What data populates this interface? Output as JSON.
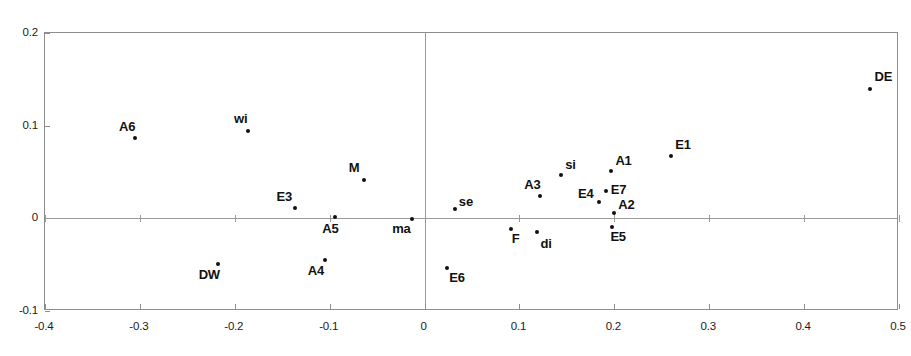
{
  "chart_data": {
    "type": "scatter",
    "title": "",
    "subtitle": "",
    "xlabel": "",
    "ylabel": "",
    "xlim": [
      -0.4,
      0.5
    ],
    "ylim": [
      -0.1,
      0.2
    ],
    "xticks": [
      "-0.4",
      "-0.3",
      "-0.2",
      "-0.1",
      "0",
      "0.1",
      "0.2",
      "0.3",
      "0.4",
      "0.5"
    ],
    "xtick_values": [
      -0.4,
      -0.3,
      -0.2,
      -0.1,
      0,
      0.1,
      0.2,
      0.3,
      0.4,
      0.5
    ],
    "yticks": [
      "0.2",
      "0.1",
      "0",
      "-0.1"
    ],
    "ytick_values": [
      0.2,
      0.1,
      0,
      -0.1
    ],
    "grid": false,
    "legend": false,
    "zero_lines": true,
    "marker_color": "#111111",
    "frame_color": "#8d8d8d",
    "axis_line_color": "#9a9a9a",
    "points": [
      {
        "label": "A6",
        "x": -0.304,
        "y": 0.086,
        "label_dx": -16,
        "label_dy": -18
      },
      {
        "label": "wi",
        "x": -0.185,
        "y": 0.093,
        "label_dx": -14,
        "label_dy": -19
      },
      {
        "label": "M",
        "x": -0.063,
        "y": 0.04,
        "label_dx": -15,
        "label_dy": -19
      },
      {
        "label": "E3",
        "x": -0.136,
        "y": 0.01,
        "label_dx": -18,
        "label_dy": -18
      },
      {
        "label": "A5",
        "x": -0.093,
        "y": 0.0,
        "label_dx": -13,
        "label_dy": 5
      },
      {
        "label": "ma",
        "x": -0.012,
        "y": -0.002,
        "label_dx": -20,
        "label_dy": 3
      },
      {
        "label": "DW",
        "x": -0.217,
        "y": -0.05,
        "label_dx": -19,
        "label_dy": 4
      },
      {
        "label": "A4",
        "x": -0.104,
        "y": -0.046,
        "label_dx": -17,
        "label_dy": 4
      },
      {
        "label": "se",
        "x": 0.033,
        "y": 0.009,
        "label_dx": 4,
        "label_dy": -14
      },
      {
        "label": "E6",
        "x": 0.025,
        "y": -0.055,
        "label_dx": 2,
        "label_dy": 3
      },
      {
        "label": "F",
        "x": 0.092,
        "y": -0.013,
        "label_dx": 1,
        "label_dy": 3
      },
      {
        "label": "di",
        "x": 0.12,
        "y": -0.016,
        "label_dx": 3,
        "label_dy": 5
      },
      {
        "label": "A3",
        "x": 0.123,
        "y": 0.023,
        "label_dx": -16,
        "label_dy": -18
      },
      {
        "label": "si",
        "x": 0.145,
        "y": 0.046,
        "label_dx": 4,
        "label_dy": -17
      },
      {
        "label": "E4",
        "x": 0.185,
        "y": 0.017,
        "label_dx": -21,
        "label_dy": -15
      },
      {
        "label": "E7",
        "x": 0.192,
        "y": 0.028,
        "label_dx": 5,
        "label_dy": -8
      },
      {
        "label": "A1",
        "x": 0.198,
        "y": 0.05,
        "label_dx": 4,
        "label_dy": -17
      },
      {
        "label": "A2",
        "x": 0.201,
        "y": 0.005,
        "label_dx": 4,
        "label_dy": -15
      },
      {
        "label": "E5",
        "x": 0.199,
        "y": -0.01,
        "label_dx": -2,
        "label_dy": 3
      },
      {
        "label": "E1",
        "x": 0.261,
        "y": 0.066,
        "label_dx": 4,
        "label_dy": -18
      },
      {
        "label": "DE",
        "x": 0.47,
        "y": 0.139,
        "label_dx": 5,
        "label_dy": -19
      }
    ]
  }
}
